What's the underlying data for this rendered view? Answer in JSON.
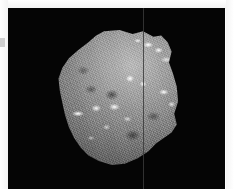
{
  "figure": {
    "title": "",
    "caption_clipped": "",
    "background_color": "#050505",
    "page_color": "#ffffff"
  },
  "plate": {
    "name": "photographic-plate",
    "background_color": "#050505",
    "width_px": 217,
    "height_px": 181
  },
  "subject": {
    "label": "rock-specimen",
    "description": "irregular angular grayscale specimen",
    "surface_tone": "#808080",
    "highlight_color": "#ffffff",
    "shadow_color": "#303030"
  },
  "artifacts": {
    "scan_line_label": "vertical-scan-line",
    "scan_line_color": "#3a3a3a",
    "edge_tick_label": "left-edge-tick",
    "edge_tick_color": "#cfcfcf"
  }
}
